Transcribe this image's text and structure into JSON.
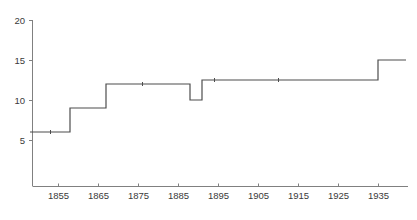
{
  "chart_data": {
    "type": "line",
    "line_style": "step-post",
    "title": "",
    "subtitle": "",
    "xlabel": "",
    "ylabel": "",
    "xlim": [
      1848,
      1942
    ],
    "ylim": [
      0,
      20
    ],
    "grid": false,
    "legend": null,
    "yticks": [
      5,
      10,
      15,
      20
    ],
    "ytick_labels": [
      "5",
      "10",
      "15",
      "20"
    ],
    "xticks": [
      1855,
      1865,
      1875,
      1885,
      1895,
      1905,
      1915,
      1925,
      1935
    ],
    "xtick_labels": [
      "1855",
      "1865",
      "1875",
      "1885",
      "1895",
      "1905",
      "1915",
      "1925",
      "1935"
    ],
    "x": [
      1848,
      1858,
      1867,
      1888,
      1891,
      1935,
      1942
    ],
    "values": [
      6,
      9,
      12,
      10,
      12.5,
      15,
      15
    ],
    "series": [
      {
        "name": "",
        "color": "#4d4d4d",
        "points": [
          {
            "x": 1848,
            "y": 6
          },
          {
            "x": 1858,
            "y": 9
          },
          {
            "x": 1867,
            "y": 12
          },
          {
            "x": 1888,
            "y": 10
          },
          {
            "x": 1891,
            "y": 12.5
          },
          {
            "x": 1935,
            "y": 15
          },
          {
            "x": 1942,
            "y": 15
          }
        ]
      }
    ],
    "markers": [
      {
        "x": 1853,
        "y": 6
      },
      {
        "x": 1876,
        "y": 12
      },
      {
        "x": 1894,
        "y": 12.5
      },
      {
        "x": 1910,
        "y": 12.5
      }
    ],
    "axis_color": "#808080",
    "line_color": "#4d4d4d",
    "background": "#ffffff"
  }
}
